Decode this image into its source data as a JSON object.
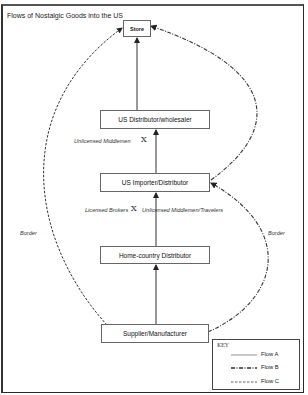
{
  "diagram": {
    "title": "Flows of Nostalgic Goods into the US",
    "nodes": [
      {
        "id": "store",
        "label": "Store"
      },
      {
        "id": "us-distributor",
        "label": "US Distributor/wholesaler"
      },
      {
        "id": "us-importer",
        "label": "US Importer/Distributor"
      },
      {
        "id": "home-distributor",
        "label": "Home-country Distributor"
      },
      {
        "id": "supplier",
        "label": "Supplier/Manufacturer"
      }
    ],
    "edge_labels": {
      "unlicensed_middlemen": "Unlicensed Middlemen",
      "licensed_brokers": "Licensed Brokers",
      "unlicensed_travelers": "Unlicensed Middlemen/Travelers",
      "cross_symbol": "X",
      "border_left": "Border",
      "border_right": "Border"
    },
    "flows": [
      {
        "name": "Flow A",
        "style": "solid",
        "path": [
          "Supplier/Manufacturer",
          "Home-country Distributor",
          "US Importer/Distributor",
          "US Distributor/wholesaler",
          "Store"
        ]
      },
      {
        "name": "Flow B",
        "style": "dash-dot",
        "path": [
          "Supplier/Manufacturer",
          "US Importer/Distributor",
          "Store"
        ]
      },
      {
        "name": "Flow C",
        "style": "dashed",
        "path": [
          "Supplier/Manufacturer",
          "Store"
        ]
      }
    ],
    "key": {
      "title": "KEY",
      "items": [
        "Flow A",
        "Flow B",
        "Flow C"
      ]
    }
  }
}
